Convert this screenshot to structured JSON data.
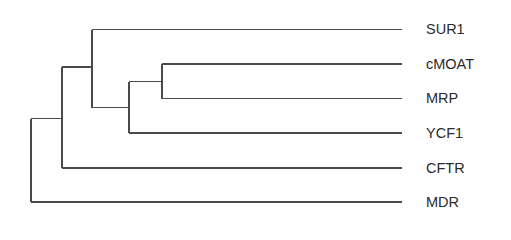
{
  "diagram": {
    "type": "dendrogram",
    "orientation": "left-to-right",
    "line_color": "#4a4a4a",
    "text_color": "#2b2b2b",
    "leaves": [
      {
        "label": "SUR1",
        "y": 29.5
      },
      {
        "label": "cMOAT",
        "y": 64
      },
      {
        "label": "MRP",
        "y": 98.5
      },
      {
        "label": "YCF1",
        "y": 133
      },
      {
        "label": "CFTR",
        "y": 168
      },
      {
        "label": "MDR",
        "y": 202
      }
    ],
    "leaf_line_end_x": 402,
    "tree": "(MDR,(CFTR,(SUR1,(YCF1,(cMOAT,MRP)))))",
    "nodes": [
      {
        "id": "cMOAT_MRP",
        "x": 162,
        "y": 81.5,
        "children": [
          "cMOAT",
          "MRP"
        ]
      },
      {
        "id": "YCF1_group",
        "x": 129,
        "y": 107.5,
        "children": [
          "cMOAT_MRP",
          "YCF1"
        ]
      },
      {
        "id": "SUR1_group",
        "x": 92,
        "y": 67,
        "children": [
          "SUR1",
          "YCF1_group"
        ]
      },
      {
        "id": "CFTR_group",
        "x": 62,
        "y": 118.5,
        "children": [
          "SUR1_group",
          "CFTR"
        ]
      },
      {
        "id": "root",
        "x": 31,
        "y": 119,
        "children": [
          "CFTR_group",
          "MDR"
        ]
      }
    ]
  }
}
